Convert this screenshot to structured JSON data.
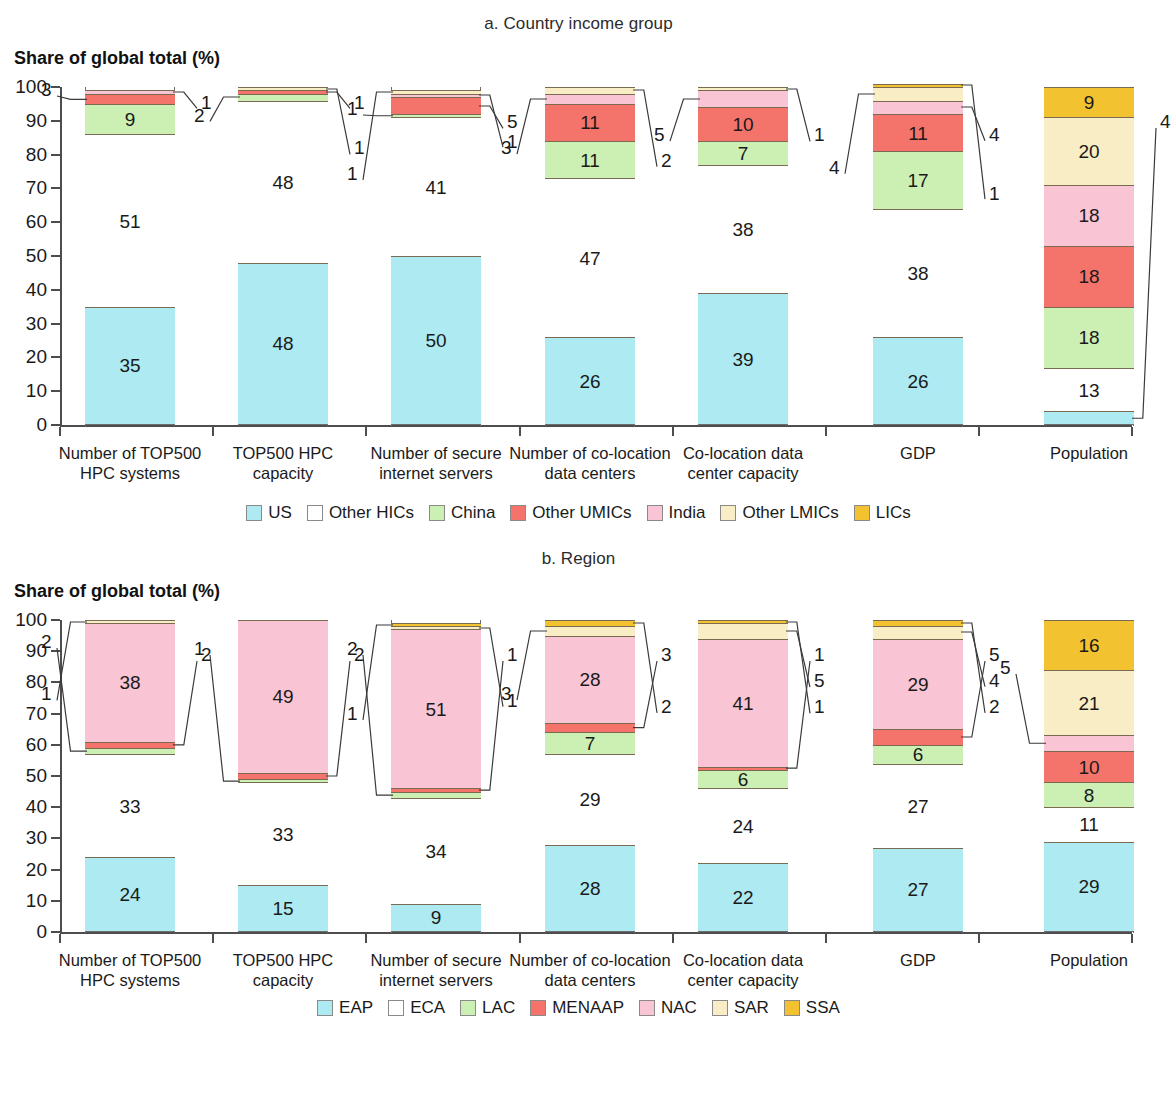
{
  "chart_data": [
    {
      "type": "bar",
      "id": "a",
      "title": "a. Country income group",
      "ylabel": "Share of global total (%)",
      "xlabel": "",
      "ylim": [
        0,
        100
      ],
      "yticks": [
        0,
        10,
        20,
        30,
        40,
        50,
        60,
        70,
        80,
        90,
        100
      ],
      "grid": false,
      "stacked": true,
      "legend_position": "bottom",
      "categories": [
        "Number of TOP500 HPC systems",
        "TOP500 HPC capacity",
        "Number of secure internet servers",
        "Number of co-location data centers",
        "Co-location data center capacity",
        "GDP",
        "Population"
      ],
      "category_lines": [
        [
          "Number of TOP500",
          "HPC systems"
        ],
        [
          "TOP500 HPC",
          "capacity"
        ],
        [
          "Number of secure",
          "internet servers"
        ],
        [
          "Number of co-location",
          "data centers"
        ],
        [
          "Co-location data",
          "center capacity"
        ],
        [
          "GDP"
        ],
        [
          "Population"
        ]
      ],
      "series": [
        {
          "name": "US",
          "color": "#aeeaf2",
          "values": [
            35,
            48,
            50,
            26,
            39,
            26,
            4
          ]
        },
        {
          "name": "Other HICs",
          "color": "#ffffff",
          "values": [
            51,
            48,
            41,
            47,
            38,
            38,
            13
          ]
        },
        {
          "name": "China",
          "color": "#ccefb4",
          "values": [
            9,
            2,
            1,
            11,
            7,
            17,
            18
          ]
        },
        {
          "name": "Other UMICs",
          "color": "#f4736a",
          "values": [
            3,
            1,
            5,
            11,
            10,
            11,
            18
          ]
        },
        {
          "name": "India",
          "color": "#f9c4d4",
          "values": [
            1,
            0,
            1,
            3,
            5,
            4,
            18
          ]
        },
        {
          "name": "Other LMICs",
          "color": "#f8edc4",
          "values": [
            0,
            1,
            1,
            2,
            1,
            4,
            20
          ]
        },
        {
          "name": "LICs",
          "color": "#f2c230",
          "values": [
            0,
            0,
            0,
            0,
            0,
            1,
            9
          ]
        }
      ]
    },
    {
      "type": "bar",
      "id": "b",
      "title": "b. Region",
      "ylabel": "Share of global total (%)",
      "xlabel": "",
      "ylim": [
        0,
        100
      ],
      "yticks": [
        0,
        10,
        20,
        30,
        40,
        50,
        60,
        70,
        80,
        90,
        100
      ],
      "grid": false,
      "stacked": true,
      "legend_position": "bottom",
      "categories": [
        "Number of TOP500 HPC systems",
        "TOP500 HPC capacity",
        "Number of secure internet servers",
        "Number of co-location data centers",
        "Co-location data center capacity",
        "GDP",
        "Population"
      ],
      "category_lines": [
        [
          "Number of TOP500",
          "HPC systems"
        ],
        [
          "TOP500 HPC",
          "capacity"
        ],
        [
          "Number of secure",
          "internet servers"
        ],
        [
          "Number of co-location",
          "data centers"
        ],
        [
          "Co-location data",
          "center capacity"
        ],
        [
          "GDP"
        ],
        [
          "Population"
        ]
      ],
      "series": [
        {
          "name": "EAP",
          "color": "#aeeaf2",
          "values": [
            24,
            15,
            9,
            28,
            22,
            27,
            29
          ]
        },
        {
          "name": "ECA",
          "color": "#ffffff",
          "values": [
            33,
            33,
            34,
            29,
            24,
            27,
            11
          ]
        },
        {
          "name": "LAC",
          "color": "#ccefb4",
          "values": [
            2,
            1,
            2,
            7,
            6,
            6,
            8
          ]
        },
        {
          "name": "MENAAP",
          "color": "#f4736a",
          "values": [
            2,
            2,
            1,
            3,
            1,
            5,
            10
          ]
        },
        {
          "name": "NAC",
          "color": "#f9c4d4",
          "values": [
            38,
            49,
            51,
            28,
            41,
            29,
            5
          ]
        },
        {
          "name": "SAR",
          "color": "#f8edc4",
          "values": [
            1,
            0,
            1,
            3,
            5,
            4,
            21
          ]
        },
        {
          "name": "SSA",
          "color": "#f2c230",
          "values": [
            0,
            0,
            1,
            2,
            1,
            2,
            16
          ]
        }
      ]
    }
  ],
  "panels": {
    "a": {
      "title": "a. Country income group",
      "ylabel": "Share of global total (%)",
      "legend": [
        {
          "label": "US",
          "color": "#aeeaf2"
        },
        {
          "label": "Other HICs",
          "color": "#ffffff"
        },
        {
          "label": "China",
          "color": "#ccefb4"
        },
        {
          "label": "Other UMICs",
          "color": "#f4736a"
        },
        {
          "label": "India",
          "color": "#f9c4d4"
        },
        {
          "label": "Other LMICs",
          "color": "#f8edc4"
        },
        {
          "label": "LICs",
          "color": "#f2c230"
        }
      ]
    },
    "b": {
      "title": "b. Region",
      "ylabel": "Share of global total (%)",
      "legend": [
        {
          "label": "EAP",
          "color": "#aeeaf2"
        },
        {
          "label": "ECA",
          "color": "#ffffff"
        },
        {
          "label": "LAC",
          "color": "#ccefb4"
        },
        {
          "label": "MENAAP",
          "color": "#f4736a"
        },
        {
          "label": "NAC",
          "color": "#f9c4d4"
        },
        {
          "label": "SAR",
          "color": "#f8edc4"
        },
        {
          "label": "SSA",
          "color": "#f2c230"
        }
      ]
    }
  }
}
